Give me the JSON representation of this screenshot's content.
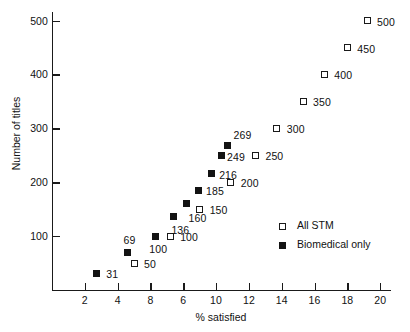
{
  "chart_data": {
    "type": "scatter",
    "title": "",
    "xlabel": "% satisfied",
    "ylabel": "Number of titles",
    "xlim": [
      0,
      20.6
    ],
    "ylim": [
      0,
      516
    ],
    "grid": false,
    "xticks": [
      {
        "value": 2,
        "label": "2"
      },
      {
        "value": 4,
        "label": "4"
      },
      {
        "value": 6,
        "label": "8"
      },
      {
        "value": 8,
        "label": "6"
      },
      {
        "value": 10,
        "label": "10"
      },
      {
        "value": 12,
        "label": "12"
      },
      {
        "value": 14,
        "label": "14"
      },
      {
        "value": 16,
        "label": "16"
      },
      {
        "value": 18,
        "label": "18"
      },
      {
        "value": 20,
        "label": "20"
      }
    ],
    "yticks": [
      {
        "value": 100,
        "label": "100"
      },
      {
        "value": 200,
        "label": "200"
      },
      {
        "value": 300,
        "label": "300"
      },
      {
        "value": 400,
        "label": "400"
      },
      {
        "value": 500,
        "label": "500"
      }
    ],
    "legend_position": "center-right",
    "series": [
      {
        "name": "All STM",
        "marker": "open-square",
        "points": [
          {
            "x": 5.0,
            "y": 50,
            "label": "50",
            "lx": 10,
            "ly": -4
          },
          {
            "x": 7.2,
            "y": 100,
            "label": "100",
            "lx": 10,
            "ly": -4
          },
          {
            "x": 9.0,
            "y": 150,
            "label": "150",
            "lx": 10,
            "ly": -4
          },
          {
            "x": 10.9,
            "y": 200,
            "label": "200",
            "lx": 10,
            "ly": -4
          },
          {
            "x": 12.4,
            "y": 250,
            "label": "250",
            "lx": 10,
            "ly": -4
          },
          {
            "x": 13.7,
            "y": 300,
            "label": "300",
            "lx": 10,
            "ly": -4
          },
          {
            "x": 15.3,
            "y": 350,
            "label": "350",
            "lx": 10,
            "ly": -4
          },
          {
            "x": 16.6,
            "y": 400,
            "label": "400",
            "lx": 10,
            "ly": -4
          },
          {
            "x": 18.0,
            "y": 450,
            "label": "450",
            "lx": 10,
            "ly": -4
          },
          {
            "x": 19.2,
            "y": 500,
            "label": "500",
            "lx": 10,
            "ly": -4
          }
        ]
      },
      {
        "name": "Biomedical only",
        "marker": "filled-square",
        "points": [
          {
            "x": 2.7,
            "y": 31,
            "label": "31",
            "lx": 10,
            "ly": -4
          },
          {
            "x": 4.6,
            "y": 69,
            "label": "69",
            "lx": -4,
            "ly": -18
          },
          {
            "x": 6.3,
            "y": 100,
            "label": "100",
            "lx": -6,
            "ly": 8
          },
          {
            "x": 7.4,
            "y": 136,
            "label": "136",
            "lx": -2,
            "ly": 8
          },
          {
            "x": 8.2,
            "y": 160,
            "label": "160",
            "lx": 2,
            "ly": 9
          },
          {
            "x": 8.9,
            "y": 185,
            "label": "185",
            "lx": 8,
            "ly": -4
          },
          {
            "x": 9.7,
            "y": 216,
            "label": "216",
            "lx": 8,
            "ly": -4
          },
          {
            "x": 10.3,
            "y": 249,
            "label": "249",
            "lx": 6,
            "ly": -4
          },
          {
            "x": 10.7,
            "y": 269,
            "label": "269",
            "lx": 6,
            "ly": -15
          }
        ]
      }
    ]
  },
  "legend": {
    "entries": [
      {
        "label": "All STM",
        "marker": "open"
      },
      {
        "label": "Biomedical only",
        "marker": "filled"
      }
    ]
  }
}
